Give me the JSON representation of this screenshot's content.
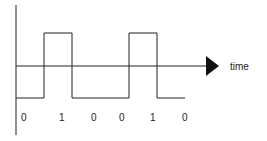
{
  "diagram": {
    "type": "digital-signal-waveform",
    "axis_label": "time",
    "bits": [
      "0",
      "1",
      "0",
      "0",
      "1",
      "0"
    ],
    "colors": {
      "line": "#222222",
      "background": "#ffffff"
    }
  }
}
